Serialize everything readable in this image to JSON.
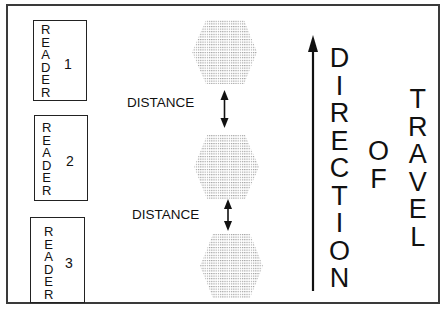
{
  "diagram": {
    "frame_color": "#3a3a3a",
    "readers": [
      {
        "word": "READER",
        "letters": [
          "R",
          "E",
          "A",
          "D",
          "E",
          "R"
        ],
        "number": "1"
      },
      {
        "word": "READER",
        "letters": [
          "R",
          "E",
          "A",
          "D",
          "E",
          "R"
        ],
        "number": "2"
      },
      {
        "word": "READER",
        "letters": [
          "R",
          "E",
          "A",
          "D",
          "E",
          "R"
        ],
        "number": "3"
      }
    ],
    "tags": [
      {
        "shape": "hexagon",
        "fill": "dotted-gray"
      },
      {
        "shape": "hexagon",
        "fill": "dotted-gray"
      },
      {
        "shape": "hexagon",
        "fill": "dotted-gray"
      }
    ],
    "distance_labels": [
      "DISTANCE",
      "DISTANCE"
    ],
    "direction_arrow": {
      "icon": "arrow-up-icon"
    },
    "direction_words": {
      "word1": {
        "text": "DIRECTION",
        "letters": [
          "D",
          "I",
          "R",
          "E",
          "C",
          "T",
          "I",
          "O",
          "N"
        ]
      },
      "word2": {
        "text": "OF",
        "letters": [
          "O",
          "F"
        ]
      },
      "word3": {
        "text": "TRAVEL",
        "letters": [
          "T",
          "R",
          "A",
          "V",
          "E",
          "L"
        ]
      }
    }
  }
}
